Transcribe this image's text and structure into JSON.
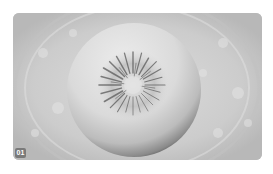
{
  "figure": {
    "panel_label": "01",
    "colors": {
      "background_light": "#d9d9d9",
      "background_dark": "#bdbdbd",
      "sphere_highlight": "#e6e6e6",
      "sphere_shadow": "#555555",
      "starburst": "#5a5a5a",
      "label_bg": "#7a7a7a"
    }
  }
}
